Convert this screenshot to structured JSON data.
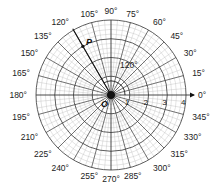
{
  "diagram": {
    "type": "polar-grid",
    "center": {
      "x": 111,
      "y": 95
    },
    "unit_px": 18.75,
    "rings": [
      1,
      2,
      3,
      4
    ],
    "minor_rings_per_unit": 4,
    "radial_step_deg": 15,
    "angle_labels": [
      "0°",
      "15°",
      "30°",
      "45°",
      "60°",
      "75°",
      "90°",
      "105°",
      "120°",
      "135°",
      "150°",
      "165°",
      "180°",
      "195°",
      "210°",
      "225°",
      "240°",
      "255°",
      "270°",
      "285°",
      "300°",
      "315°",
      "330°",
      "345°"
    ],
    "radius_labels": [
      "1",
      "2",
      "3",
      "4"
    ],
    "origin_label": "O",
    "point": {
      "label": "P",
      "r": 3,
      "theta_deg": 120
    },
    "angle_annotation": "120°",
    "colors": {
      "grid": "#333333",
      "minor_grid": "#bbbbbb",
      "text": "#222222"
    }
  }
}
